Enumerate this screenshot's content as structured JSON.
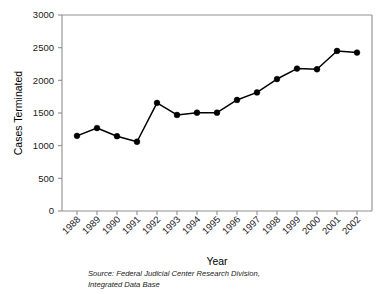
{
  "chart_data": {
    "type": "line",
    "title": "",
    "xlabel": "Year",
    "ylabel": "Cases Terminated",
    "categories": [
      "1988",
      "1989",
      "1990",
      "1991",
      "1992",
      "1993",
      "1994",
      "1995",
      "1996",
      "1997",
      "1998",
      "1999",
      "2000",
      "2001",
      "2002"
    ],
    "values": [
      1150,
      1270,
      1145,
      1060,
      1655,
      1470,
      1505,
      1505,
      1700,
      1815,
      2020,
      2180,
      2170,
      2450,
      2425
    ],
    "series": [
      {
        "name": "Cases Terminated",
        "values": [
          1150,
          1270,
          1145,
          1060,
          1655,
          1470,
          1505,
          1505,
          1700,
          1815,
          2020,
          2180,
          2170,
          2450,
          2425
        ]
      }
    ],
    "ylim": [
      0,
      3000
    ],
    "ytick_labels": [
      "0",
      "500",
      "1000",
      "1500",
      "2000",
      "2500",
      "3000"
    ],
    "ytick_values": [
      0,
      500,
      1000,
      1500,
      2000,
      2500,
      3000
    ],
    "grid": false,
    "legend": "none",
    "marker": "filled-circle",
    "line_color": "#000000",
    "marker_color": "#000000",
    "axis_color": "#8f8f8f"
  },
  "source_note": {
    "line1": "Source: Federal Judicial Center Research Division,",
    "line2": "Integrated Data Base"
  }
}
